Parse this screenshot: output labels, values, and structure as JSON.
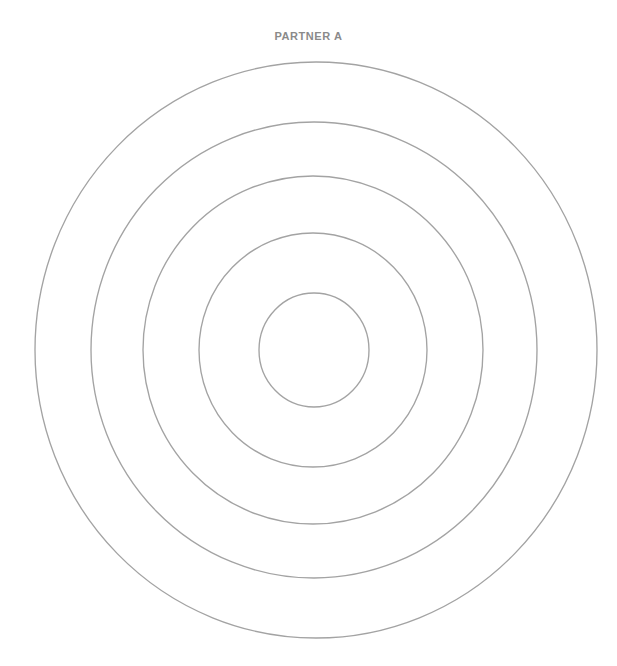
{
  "page": {
    "title": "PARTNER A",
    "background_color": "#ffffff",
    "width": 617,
    "height": 666
  },
  "title": {
    "label": "PARTNER A",
    "color": "#8a8a8a"
  },
  "chart_data": {
    "type": "scatter",
    "title": "PARTNER A",
    "subtitle": "",
    "xlabel": "",
    "ylabel": "",
    "variant": "concentric-circles-template",
    "grid": false,
    "legend": false,
    "legend_position": "none",
    "series": [],
    "categories": [],
    "values": [],
    "annotations": [],
    "stroke_color": "#a3a3a3",
    "fill_color": "none",
    "stroke_width": 1.35,
    "ring_count": 5,
    "rings": [
      {
        "name": "ring-1-outermost",
        "level": 1,
        "label": "",
        "cx": 316,
        "cy": 350,
        "rx": 281,
        "ry": 288
      },
      {
        "name": "ring-2",
        "level": 2,
        "label": "",
        "cx": 314,
        "cy": 350,
        "rx": 223,
        "ry": 228
      },
      {
        "name": "ring-3",
        "level": 3,
        "label": "",
        "cx": 313,
        "cy": 350,
        "rx": 170,
        "ry": 174
      },
      {
        "name": "ring-4",
        "level": 4,
        "label": "",
        "cx": 313,
        "cy": 350,
        "rx": 114,
        "ry": 117
      },
      {
        "name": "ring-5-innermost",
        "level": 5,
        "label": "",
        "cx": 314,
        "cy": 350,
        "rx": 55,
        "ry": 57
      }
    ],
    "center": {
      "x": 316,
      "y": 350
    },
    "xlim": [
      0,
      617
    ],
    "ylim": [
      0,
      666
    ]
  }
}
